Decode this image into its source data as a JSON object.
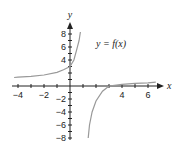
{
  "chart_data": {
    "type": "line",
    "title": "",
    "xlabel": "x",
    "ylabel": "y",
    "xlim": [
      -4.3,
      6.6
    ],
    "ylim": [
      -8.4,
      9.5
    ],
    "grid": false,
    "x_ticks": [
      -4,
      -3,
      -2,
      -1,
      1,
      2,
      3,
      4,
      5,
      6
    ],
    "x_tick_labels": [
      "-4",
      "-2",
      "4",
      "6"
    ],
    "y_ticks": [
      -8,
      -7,
      -6,
      -5,
      -4,
      -3,
      -2,
      -1,
      1,
      2,
      3,
      4,
      5,
      6,
      7,
      8
    ],
    "y_tick_labels": [
      "8",
      "6",
      "4",
      "-2",
      "-4",
      "-6",
      "-8"
    ],
    "annotations": [
      {
        "text": "y = f(x)",
        "x": 3.5,
        "y": 6.5
      }
    ],
    "series": [
      {
        "name": "y = f(x) left branch",
        "points": [
          [
            -4.3,
            1.3
          ],
          [
            -4,
            1.35
          ],
          [
            -3,
            1.5
          ],
          [
            -2,
            1.7
          ],
          [
            -1,
            2.1
          ],
          [
            -0.5,
            2.5
          ],
          [
            0,
            3
          ],
          [
            0.3,
            4
          ],
          [
            0.5,
            5.5
          ],
          [
            0.7,
            7
          ],
          [
            0.8,
            8.3
          ]
        ]
      },
      {
        "name": "y = f(x) right branch",
        "points": [
          [
            1.4,
            -8
          ],
          [
            1.5,
            -6
          ],
          [
            1.7,
            -4
          ],
          [
            2,
            -2.3
          ],
          [
            2.5,
            -0.8
          ],
          [
            3,
            0
          ],
          [
            4,
            0.25
          ],
          [
            5,
            0.4
          ],
          [
            6,
            0.5
          ],
          [
            6.6,
            0.6
          ]
        ]
      }
    ]
  },
  "labels": {
    "y_axis": "y",
    "x_axis": "x",
    "function": "y = f(x)",
    "x_ticks": {
      "m4": "−4",
      "m2": "−2",
      "p4": "4",
      "p6": "6"
    },
    "y_ticks": {
      "p8": "8",
      "p6": "6",
      "p4": "4",
      "m2": "−2",
      "m4": "−4",
      "m6": "−6",
      "m8": "−8"
    }
  }
}
